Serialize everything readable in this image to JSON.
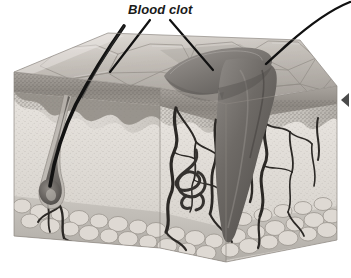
{
  "figure": {
    "type": "anatomical-illustration",
    "style": "grayscale pencil/airbrush medical illustration",
    "background_color": "#ffffff"
  },
  "labels": [
    {
      "id": "blood-clot",
      "text": "Blood clot",
      "style": "bold italic",
      "color": "#1a1a1a",
      "x": 128,
      "y": 2
    }
  ],
  "leader_lines": [
    {
      "id": "leader-left",
      "from_label": "Blood clot",
      "points": "150,20 110,72",
      "color": "#111111",
      "width": 2.2
    },
    {
      "id": "leader-right",
      "from_label": "Blood clot",
      "points": "170,20 213,70",
      "color": "#111111",
      "width": 2.2
    },
    {
      "id": "leader-curve-right",
      "from_label": "",
      "points": "349,2 318,18 288,44 268,62",
      "color": "#111111",
      "width": 2.4
    }
  ],
  "markers": [
    {
      "id": "right-edge-arrowhead",
      "shape": "triangle-left",
      "color": "#2b2b2b",
      "x": 343,
      "y": 100
    }
  ],
  "anatomy": {
    "layers": [
      {
        "name": "epidermis",
        "tone": "#9a948f",
        "note": "dark stippled band beneath the scaly surface"
      },
      {
        "name": "dermis",
        "tone": "#cfcbc6",
        "note": "light stippled middle layer containing vessels and follicles"
      },
      {
        "name": "hypodermis",
        "tone": "#b8b4af",
        "note": "bottom layer of rounded adipose (fat) cells"
      }
    ],
    "surface": {
      "name": "skin-surface",
      "tone": "#b9b4ae",
      "note": "polygonal scaly keratin plates on the top face"
    },
    "structures": [
      {
        "name": "hair-shaft",
        "tone": "#121212",
        "note": "thick dark hair emerging at the left"
      },
      {
        "name": "hair-follicle",
        "tone": "#6e6a66",
        "note": "follicle bulb deep in the dermis"
      },
      {
        "name": "blood-clot",
        "tone": "#6f6b68",
        "note": "dark wedge-shaped clot plugging the wound"
      },
      {
        "name": "scab",
        "tone": "#7d7975",
        "note": "raised clot surface above the skin"
      },
      {
        "name": "blood-vessels",
        "tone": "#2e2b29",
        "note": "branching dark vessels through the dermis"
      },
      {
        "name": "sweat-gland",
        "tone": "#3a3735",
        "note": "coiled tubular gland at the dermis base"
      },
      {
        "name": "adipose-cells",
        "tone": "#d6d2cd",
        "note": "rounded fat lobules in the bottom layer"
      }
    ]
  },
  "colors": {
    "ink": "#111111",
    "label_text": "#1a1a1a",
    "surface_light": "#d8d4cf",
    "surface_mid": "#b5b0aa",
    "surface_dark": "#8e8984",
    "clot_dark": "#5d5a57",
    "clot_mid": "#7a7672",
    "fat_light": "#e2ded9",
    "fat_line": "#9b968f",
    "vessel": "#2a2725"
  }
}
